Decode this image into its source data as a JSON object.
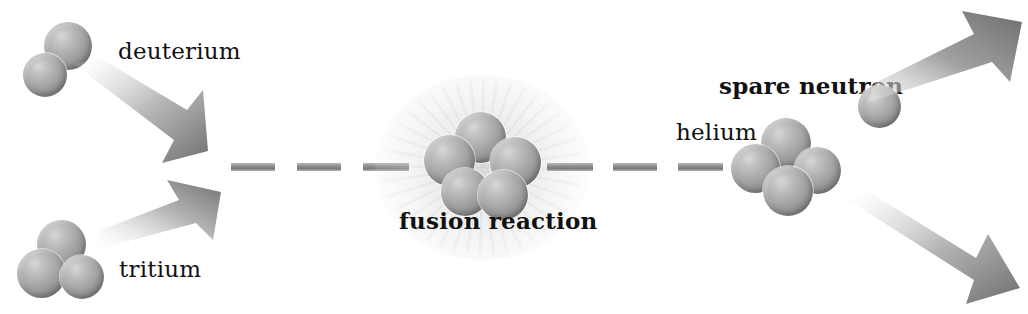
{
  "diagram": {
    "width": 1028,
    "height": 314,
    "background": "#ffffff"
  },
  "labels": {
    "deuterium": "deuterium",
    "tritium": "tritium",
    "fusion_reaction": "fusion reaction",
    "helium": "helium",
    "spare_neutron": "spare neutron"
  },
  "colors": {
    "nucleon_highlight": "#d8d8d8",
    "nucleon_midtone": "#a8a8a8",
    "nucleon_shadow": "#707070",
    "arrow_dark": "#808080",
    "arrow_light": "#f2f2f2",
    "dash": "#8e8e8e",
    "text": "#111111",
    "glow": "#c8c8c8"
  },
  "groups": {
    "deuterium": {
      "label": "deuterium",
      "nucleon_count": 2
    },
    "tritium": {
      "label": "tritium",
      "nucleon_count": 3
    },
    "fusion": {
      "label": "fusion reaction",
      "nucleon_count": 5
    },
    "helium": {
      "label": "helium",
      "nucleon_count": 4
    },
    "spare_neutron": {
      "label": "spare neutron",
      "nucleon_count": 1
    }
  },
  "dashes": {
    "left_count": 3,
    "right_count": 3
  },
  "arrows": {
    "deuterium_in": "arrow pointing down-right",
    "tritium_in": "arrow pointing up-right",
    "neutron_out": "arrow pointing up-right",
    "helium_out": "arrow pointing down-right"
  }
}
